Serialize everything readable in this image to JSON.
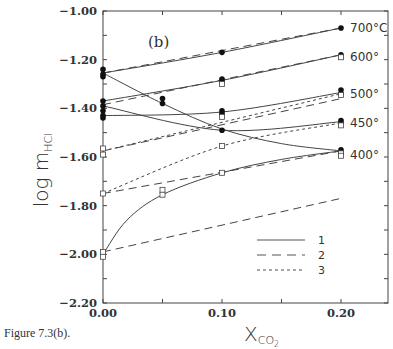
{
  "chart_data": {
    "type": "line",
    "title": "(b)",
    "caption": "Figure 7.3(b).",
    "xlabel": "X_CO2",
    "xlabel_main": "X",
    "xlabel_sub": "CO",
    "xlabel_subsub": "2",
    "ylabel": "log m_HCl",
    "ylabel_main": "log  m",
    "ylabel_sub": "HCl",
    "xlim": [
      0.0,
      0.24
    ],
    "ylim": [
      -2.2,
      -1.0
    ],
    "xticks": [
      "0.00",
      "0.10",
      "0.20"
    ],
    "yticks": [
      "-1.00",
      "-1.20",
      "-1.40",
      "-1.60",
      "-1.80",
      "-2.00",
      "-2.20"
    ],
    "grid": false,
    "legend": {
      "position": "lower right",
      "entries": [
        {
          "label": "1",
          "style": "solid"
        },
        {
          "label": "2",
          "style": "long-dash"
        },
        {
          "label": "3",
          "style": "short-dash"
        }
      ]
    },
    "temperature_labels": [
      {
        "label": "700°C",
        "y": -1.07
      },
      {
        "label": "600°",
        "y": -1.19
      },
      {
        "label": "500°",
        "y": -1.34
      },
      {
        "label": "450°",
        "y": -1.46
      },
      {
        "label": "400°",
        "y": -1.59
      }
    ],
    "series": [
      {
        "name": "700°C model 1",
        "style": "solid",
        "x": [
          0.0,
          0.1,
          0.2
        ],
        "y": [
          -1.255,
          -1.17,
          -1.07
        ]
      },
      {
        "name": "700°C model 2",
        "style": "long-dash",
        "x": [
          0.0,
          0.2
        ],
        "y": [
          -1.255,
          -1.07
        ]
      },
      {
        "name": "600° model 1",
        "style": "solid",
        "x": [
          0.0,
          0.1,
          0.2
        ],
        "y": [
          -1.37,
          -1.285,
          -1.18
        ]
      },
      {
        "name": "600° model 2",
        "style": "long-dash",
        "x": [
          0.0,
          0.2
        ],
        "y": [
          -1.385,
          -1.18
        ]
      },
      {
        "name": "500° model 1",
        "style": "solid",
        "x": [
          0.0,
          0.1,
          0.2
        ],
        "y": [
          -1.43,
          -1.415,
          -1.335
        ]
      },
      {
        "name": "500° model 2",
        "style": "long-dash",
        "x": [
          0.0,
          0.2
        ],
        "y": [
          -1.575,
          -1.36
        ]
      },
      {
        "name": "500° model 3",
        "style": "short-dash",
        "x": [
          0.0,
          0.2
        ],
        "y": [
          -1.575,
          -1.34
        ]
      },
      {
        "name": "450° model 1",
        "style": "solid",
        "x": [
          0.0,
          0.1,
          0.2
        ],
        "y": [
          -1.39,
          -1.49,
          -1.455
        ]
      },
      {
        "name": "450° model 3",
        "style": "short-dash",
        "x": [
          0.0,
          0.1,
          0.2
        ],
        "y": [
          -1.75,
          -1.555,
          -1.46
        ]
      },
      {
        "name": "450° model 2",
        "style": "long-dash",
        "x": [
          0.0,
          0.2
        ],
        "y": [
          -1.75,
          -1.575
        ]
      },
      {
        "name": "400° model 1 (curve)",
        "style": "solid",
        "x": [
          0.0,
          0.02,
          0.05,
          0.1,
          0.15,
          0.2
        ],
        "y": [
          -2.0,
          -1.86,
          -1.755,
          -1.665,
          -1.61,
          -1.575
        ]
      },
      {
        "name": "400° model 2",
        "style": "long-dash",
        "x": [
          0.0,
          0.2
        ],
        "y": [
          -1.99,
          -1.77
        ]
      },
      {
        "name": "decreasing curve (from 700°C start)",
        "style": "solid",
        "x": [
          0.0,
          0.05,
          0.1,
          0.15,
          0.2
        ],
        "y": [
          -1.255,
          -1.38,
          -1.485,
          -1.545,
          -1.575
        ]
      }
    ],
    "points_filled": [
      {
        "x": 0.0,
        "y": -1.24
      },
      {
        "x": 0.0,
        "y": -1.26
      },
      {
        "x": 0.0,
        "y": -1.27
      },
      {
        "x": 0.0,
        "y": -1.37
      },
      {
        "x": 0.0,
        "y": -1.39
      },
      {
        "x": 0.0,
        "y": -1.41
      },
      {
        "x": 0.0,
        "y": -1.43
      },
      {
        "x": 0.0,
        "y": -1.44
      },
      {
        "x": 0.05,
        "y": -1.36
      },
      {
        "x": 0.05,
        "y": -1.38
      },
      {
        "x": 0.1,
        "y": -1.17
      },
      {
        "x": 0.1,
        "y": -1.28
      },
      {
        "x": 0.1,
        "y": -1.29
      },
      {
        "x": 0.1,
        "y": -1.41
      },
      {
        "x": 0.1,
        "y": -1.42
      },
      {
        "x": 0.1,
        "y": -1.49
      },
      {
        "x": 0.2,
        "y": -1.07
      },
      {
        "x": 0.2,
        "y": -1.18
      },
      {
        "x": 0.2,
        "y": -1.325
      },
      {
        "x": 0.2,
        "y": -1.34
      },
      {
        "x": 0.2,
        "y": -1.45
      },
      {
        "x": 0.2,
        "y": -1.46
      },
      {
        "x": 0.2,
        "y": -1.57
      },
      {
        "x": 0.2,
        "y": -1.58
      }
    ],
    "points_open": [
      {
        "x": 0.0,
        "y": -1.565
      },
      {
        "x": 0.0,
        "y": -1.59
      },
      {
        "x": 0.0,
        "y": -1.75
      },
      {
        "x": 0.0,
        "y": -1.99
      },
      {
        "x": 0.0,
        "y": -2.01
      },
      {
        "x": 0.05,
        "y": -1.735
      },
      {
        "x": 0.05,
        "y": -1.755
      },
      {
        "x": 0.1,
        "y": -1.3
      },
      {
        "x": 0.1,
        "y": -1.435
      },
      {
        "x": 0.1,
        "y": -1.555
      },
      {
        "x": 0.1,
        "y": -1.665
      },
      {
        "x": 0.2,
        "y": -1.19
      },
      {
        "x": 0.2,
        "y": -1.345
      },
      {
        "x": 0.2,
        "y": -1.47
      },
      {
        "x": 0.2,
        "y": -1.585
      },
      {
        "x": 0.2,
        "y": -1.595
      }
    ]
  },
  "figure": {
    "caption": "Figure 7.3(b)."
  }
}
